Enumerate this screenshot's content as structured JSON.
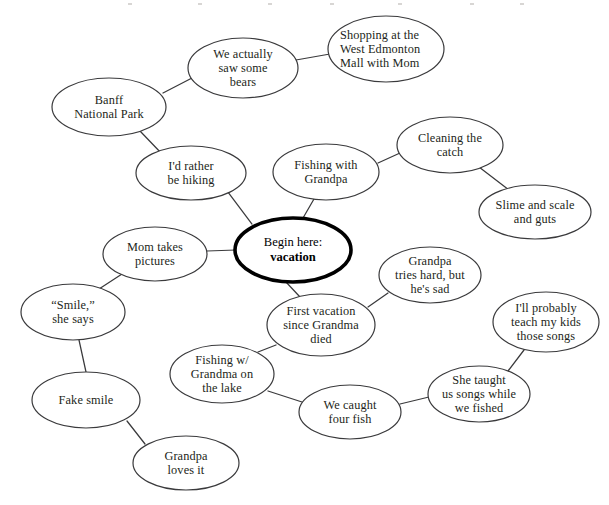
{
  "diagram": {
    "type": "mind-map",
    "background_color": "#ffffff",
    "node_stroke_color": "#3a3a3c",
    "center_stroke_color": "#000000",
    "text_color": "#231f20",
    "nodes": [
      {
        "id": "center",
        "label": "Begin here: vacation",
        "line1": "Begin here:",
        "line2": "vacation",
        "emphasis": "center",
        "cx": 293,
        "cy": 250,
        "rx": 58,
        "ry": 32
      },
      {
        "id": "banff",
        "label": "Banff\nNational Park",
        "cx": 109,
        "cy": 107,
        "rx": 57,
        "ry": 29
      },
      {
        "id": "bears",
        "label": "We actually\nsaw some\nbears",
        "cx": 243,
        "cy": 68,
        "rx": 55,
        "ry": 30
      },
      {
        "id": "shopping",
        "label": "Shopping at the\nWest Edmonton\nMall with Mom",
        "align": "left",
        "cx": 386,
        "cy": 49,
        "rx": 58,
        "ry": 33
      },
      {
        "id": "hiking",
        "label": "I'd rather\nbe hiking",
        "cx": 191,
        "cy": 173,
        "rx": 55,
        "ry": 27
      },
      {
        "id": "fishing-grandpa",
        "label": "Fishing with\nGrandpa",
        "cx": 326,
        "cy": 172,
        "rx": 53,
        "ry": 28
      },
      {
        "id": "cleaning",
        "label": "Cleaning the\ncatch",
        "cx": 450,
        "cy": 145,
        "rx": 53,
        "ry": 28
      },
      {
        "id": "slime",
        "label": "Slime and scale\nand guts",
        "cx": 535,
        "cy": 212,
        "rx": 56,
        "ry": 27
      },
      {
        "id": "mom-pictures",
        "label": "Mom takes\npictures",
        "cx": 155,
        "cy": 254,
        "rx": 52,
        "ry": 27
      },
      {
        "id": "smile",
        "label": "“Smile,”\nshe says",
        "cx": 73,
        "cy": 312,
        "rx": 52,
        "ry": 28
      },
      {
        "id": "fake-smile",
        "label": "Fake smile",
        "cx": 86,
        "cy": 400,
        "rx": 54,
        "ry": 28
      },
      {
        "id": "grandpa-loves",
        "label": "Grandpa\nloves it",
        "cx": 186,
        "cy": 463,
        "rx": 53,
        "ry": 27
      },
      {
        "id": "first-vacation",
        "label": "First vacation\nsince Grandma\ndied",
        "cx": 321,
        "cy": 325,
        "rx": 54,
        "ry": 31
      },
      {
        "id": "grandpa-sad",
        "label": "Grandpa\ntries hard, but\nhe's sad",
        "cx": 430,
        "cy": 275,
        "rx": 51,
        "ry": 28
      },
      {
        "id": "fishing-grandma",
        "label": "Fishing w/\nGrandma on\nthe lake",
        "cx": 222,
        "cy": 374,
        "rx": 52,
        "ry": 29
      },
      {
        "id": "four-fish",
        "label": "We caught\nfour fish",
        "cx": 350,
        "cy": 412,
        "rx": 51,
        "ry": 27
      },
      {
        "id": "she-taught",
        "label": "She taught\nus songs while\nwe fished",
        "cx": 479,
        "cy": 394,
        "rx": 51,
        "ry": 28
      },
      {
        "id": "teach-kids",
        "label": "I'll probably\nteach my kids\nthose songs",
        "cx": 546,
        "cy": 322,
        "rx": 53,
        "ry": 30
      }
    ],
    "edges": [
      {
        "from": "banff",
        "to": "bears",
        "x1": 163,
        "y1": 93,
        "x2": 192,
        "y2": 78
      },
      {
        "from": "bears",
        "to": "shopping",
        "x1": 296,
        "y1": 60,
        "x2": 330,
        "y2": 54
      },
      {
        "from": "banff",
        "to": "hiking",
        "x1": 140,
        "y1": 131,
        "x2": 163,
        "y2": 155
      },
      {
        "from": "hiking",
        "to": "center",
        "x1": 228,
        "y1": 192,
        "x2": 252,
        "y2": 224
      },
      {
        "from": "center",
        "to": "fishing-grandpa",
        "x1": 303,
        "y1": 218,
        "x2": 314,
        "y2": 199
      },
      {
        "from": "fishing-grandpa",
        "to": "cleaning",
        "x1": 378,
        "y1": 163,
        "x2": 400,
        "y2": 153
      },
      {
        "from": "cleaning",
        "to": "slime",
        "x1": 479,
        "y1": 167,
        "x2": 509,
        "y2": 190
      },
      {
        "from": "center",
        "to": "mom-pictures",
        "x1": 236,
        "y1": 250,
        "x2": 207,
        "y2": 251
      },
      {
        "from": "mom-pictures",
        "to": "smile",
        "x1": 122,
        "y1": 274,
        "x2": 99,
        "y2": 289
      },
      {
        "from": "smile",
        "to": "fake-smile",
        "x1": 79,
        "y1": 340,
        "x2": 86,
        "y2": 372
      },
      {
        "from": "fake-smile",
        "to": "grandpa-loves",
        "x1": 127,
        "y1": 421,
        "x2": 145,
        "y2": 444
      },
      {
        "from": "center",
        "to": "first-vacation",
        "x1": 286,
        "y1": 282,
        "x2": 300,
        "y2": 297
      },
      {
        "from": "first-vacation",
        "to": "grandpa-sad",
        "x1": 368,
        "y1": 307,
        "x2": 388,
        "y2": 293
      },
      {
        "from": "first-vacation",
        "to": "fishing-grandma",
        "x1": 276,
        "y1": 345,
        "x2": 258,
        "y2": 352
      },
      {
        "from": "fishing-grandma",
        "to": "four-fish",
        "x1": 268,
        "y1": 391,
        "x2": 302,
        "y2": 402
      },
      {
        "from": "four-fish",
        "to": "she-taught",
        "x1": 400,
        "y1": 404,
        "x2": 429,
        "y2": 397
      },
      {
        "from": "she-taught",
        "to": "teach-kids",
        "x1": 508,
        "y1": 371,
        "x2": 524,
        "y2": 350
      }
    ]
  }
}
